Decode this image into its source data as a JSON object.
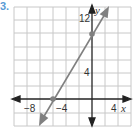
{
  "problem_number": "3.",
  "graph": {
    "x_axis_label": "x",
    "y_axis_label": "y",
    "x_tick_labels": [
      "−8",
      "−4",
      "4"
    ],
    "y_tick_labels": [
      "12",
      "4"
    ],
    "grid_step": 2,
    "x_range": [
      -12,
      6
    ],
    "y_range": [
      -4,
      14
    ],
    "line": {
      "points": [
        [
          -6,
          0
        ],
        [
          0,
          10
        ]
      ],
      "color": "#808080"
    },
    "colors": {
      "grid": "#c8c8c8",
      "axes": "#222222",
      "line": "#808080",
      "number": "#5a9bd5"
    }
  }
}
